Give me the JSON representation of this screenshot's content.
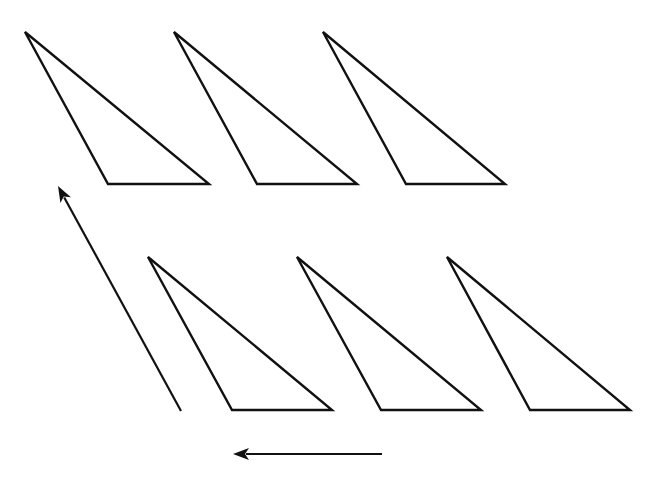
{
  "diagram": {
    "stroke_color": "#111111",
    "background_color": "#ffffff",
    "triangles": [
      {
        "id": "top-1",
        "points": [
          [
            25,
            32
          ],
          [
            108,
            184
          ],
          [
            209,
            184
          ]
        ]
      },
      {
        "id": "top-2",
        "points": [
          [
            174,
            32
          ],
          [
            257,
            184
          ],
          [
            357,
            184
          ]
        ]
      },
      {
        "id": "top-3",
        "points": [
          [
            323,
            32
          ],
          [
            406,
            184
          ],
          [
            505,
            184
          ]
        ]
      },
      {
        "id": "bottom-1",
        "points": [
          [
            148,
            257
          ],
          [
            232,
            410
          ],
          [
            332,
            410
          ]
        ]
      },
      {
        "id": "bottom-2",
        "points": [
          [
            297,
            257
          ],
          [
            381,
            410
          ],
          [
            481,
            410
          ]
        ]
      },
      {
        "id": "bottom-3",
        "points": [
          [
            447,
            257
          ],
          [
            530,
            410
          ],
          [
            630,
            410
          ]
        ]
      }
    ],
    "arrows": [
      {
        "id": "diagonal-arrow",
        "direction": "up-left",
        "from": [
          181,
          411
        ],
        "to": [
          58,
          186
        ]
      },
      {
        "id": "horizontal-arrow",
        "direction": "left",
        "from": [
          382,
          454
        ],
        "to": [
          233,
          454
        ]
      }
    ]
  }
}
